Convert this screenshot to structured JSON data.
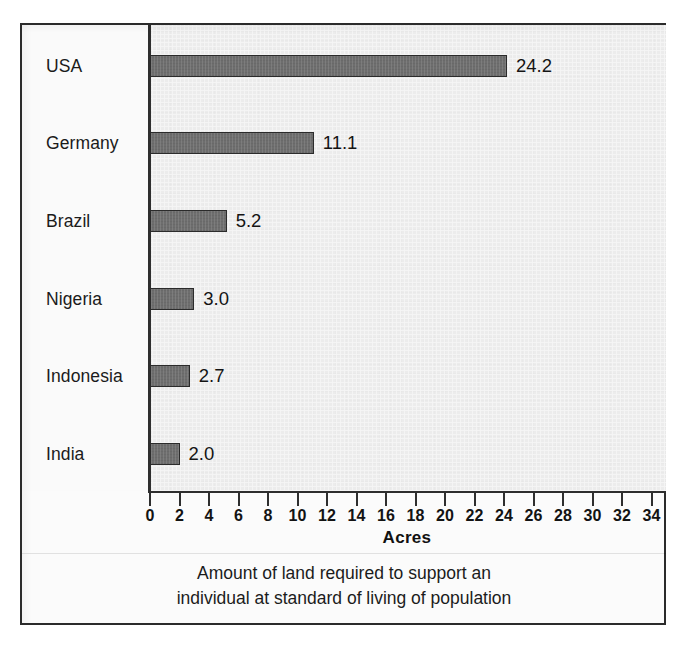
{
  "chart_data": {
    "type": "bar",
    "orientation": "horizontal",
    "title": "",
    "subtitle": "",
    "xlabel": "Acres",
    "ylabel": "",
    "xlim": [
      0,
      34
    ],
    "xticks": [
      0,
      2,
      4,
      6,
      8,
      10,
      12,
      14,
      16,
      18,
      20,
      22,
      24,
      26,
      28,
      30,
      32,
      34
    ],
    "xtick_labels": [
      "0",
      "2",
      "4",
      "6",
      "8",
      "10",
      "12",
      "14",
      "16",
      "18",
      "20",
      "22",
      "24",
      "26",
      "28",
      "30",
      "32",
      "34"
    ],
    "grid": false,
    "legend": false,
    "legend_position": "none",
    "categories": [
      "USA",
      "Germany",
      "Brazil",
      "Nigeria",
      "Indonesia",
      "India"
    ],
    "values": [
      24.2,
      11.1,
      5.2,
      3.0,
      2.7,
      2.0
    ],
    "data_labels": [
      "24.2",
      "11.1",
      "5.2",
      "3.0",
      "2.7",
      "2.0"
    ],
    "caption": "Amount of land required to support an individual at standard of living of population",
    "caption_lines": [
      "Amount of land required to support an",
      "individual at standard of living of population"
    ],
    "colors": {
      "bar_fill": "#6e6e6e",
      "bar_stroke": "#2b2b2b",
      "plot_background": "#ececec",
      "label_gutter_background": "#fafafa",
      "axis": "#2e2e2e",
      "text": "#1b1b1b",
      "frame_border": "#2b2b2b",
      "page_background": "#ffffff"
    }
  },
  "figure": {
    "axis_title": "Acres",
    "caption_line_1": "Amount of land required to support an",
    "caption_line_2": "individual at standard of living of population"
  },
  "rows": [
    {
      "label": "USA",
      "value": 24.2,
      "value_label": "24.2"
    },
    {
      "label": "Germany",
      "value": 11.1,
      "value_label": "11.1"
    },
    {
      "label": "Brazil",
      "value": 5.2,
      "value_label": "5.2"
    },
    {
      "label": "Nigeria",
      "value": 3.0,
      "value_label": "3.0"
    },
    {
      "label": "Indonesia",
      "value": 2.7,
      "value_label": "2.7"
    },
    {
      "label": "India",
      "value": 2.0,
      "value_label": "2.0"
    }
  ],
  "xticks": [
    "0",
    "2",
    "4",
    "6",
    "8",
    "10",
    "12",
    "14",
    "16",
    "18",
    "20",
    "22",
    "24",
    "26",
    "28",
    "30",
    "32",
    "34"
  ]
}
